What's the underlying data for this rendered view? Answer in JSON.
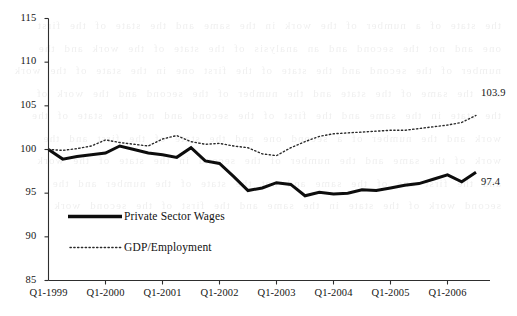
{
  "chart_data": {
    "type": "line",
    "title": "",
    "subtitle": "",
    "xlabel": "",
    "ylabel": "",
    "ylim": [
      85,
      115
    ],
    "ytick_step": 5,
    "yticks": [
      "85",
      "90",
      "95",
      "100",
      "105",
      "110",
      "115"
    ],
    "xticks": [
      "Q1-1999",
      "Q1-2000",
      "Q1-2001",
      "Q1-2002",
      "Q1-2003",
      "Q1-2004",
      "Q1-2005",
      "Q1-2006"
    ],
    "x": [
      "Q1-1999",
      "Q2-1999",
      "Q3-1999",
      "Q4-1999",
      "Q1-2000",
      "Q2-2000",
      "Q3-2000",
      "Q4-2000",
      "Q1-2001",
      "Q2-2001",
      "Q3-2001",
      "Q4-2001",
      "Q1-2002",
      "Q2-2002",
      "Q3-2002",
      "Q4-2002",
      "Q1-2003",
      "Q2-2003",
      "Q3-2003",
      "Q4-2003",
      "Q1-2004",
      "Q2-2004",
      "Q3-2004",
      "Q4-2004",
      "Q1-2005",
      "Q2-2005",
      "Q3-2005",
      "Q4-2005",
      "Q1-2006",
      "Q2-2006",
      "Q3-2006"
    ],
    "grid": false,
    "legend_position": "inside-lower-left",
    "series": [
      {
        "name": "Private Sector Wages",
        "style": "solid",
        "width": 3.0,
        "color": "#0d0d0d",
        "end_label": "97.4",
        "values": [
          100.0,
          98.9,
          99.2,
          99.4,
          99.6,
          100.4,
          100.0,
          99.6,
          99.4,
          99.1,
          100.2,
          98.7,
          98.4,
          96.9,
          95.3,
          95.6,
          96.2,
          96.0,
          94.7,
          95.1,
          94.9,
          95.0,
          95.4,
          95.3,
          95.6,
          95.9,
          96.1,
          96.6,
          97.1,
          96.3,
          97.4
        ]
      },
      {
        "name": "GDP/Employment",
        "style": "dotted",
        "width": 1.4,
        "color": "#2a2a2a",
        "end_label": "103.9",
        "values": [
          100.0,
          99.9,
          100.1,
          100.4,
          101.1,
          100.8,
          100.6,
          100.4,
          101.2,
          101.6,
          100.9,
          100.6,
          100.7,
          100.4,
          100.2,
          99.5,
          99.3,
          100.2,
          100.9,
          101.5,
          101.8,
          101.9,
          102.0,
          102.1,
          102.2,
          102.2,
          102.4,
          102.6,
          102.8,
          103.1,
          103.9
        ]
      }
    ]
  },
  "legend": {
    "items": [
      {
        "label": "Private Sector Wages",
        "style": "solid"
      },
      {
        "label": "GDP/Employment",
        "style": "dotted"
      }
    ]
  },
  "bleed_text": "the state of a number of the work in the same and the state of the first one and not the second and an analysis of the state of the work and the number of the second and the state of the first one in the state of the work and the same of the state and the number of the second and the work of the state in the same and the first of the second and not the state of the work and the number of a second one and the state of the first and the work of the same and the number of the second in the state of the work and the first one of the same and not the state of the number and the second work of the state in the same and the first of the second work"
}
